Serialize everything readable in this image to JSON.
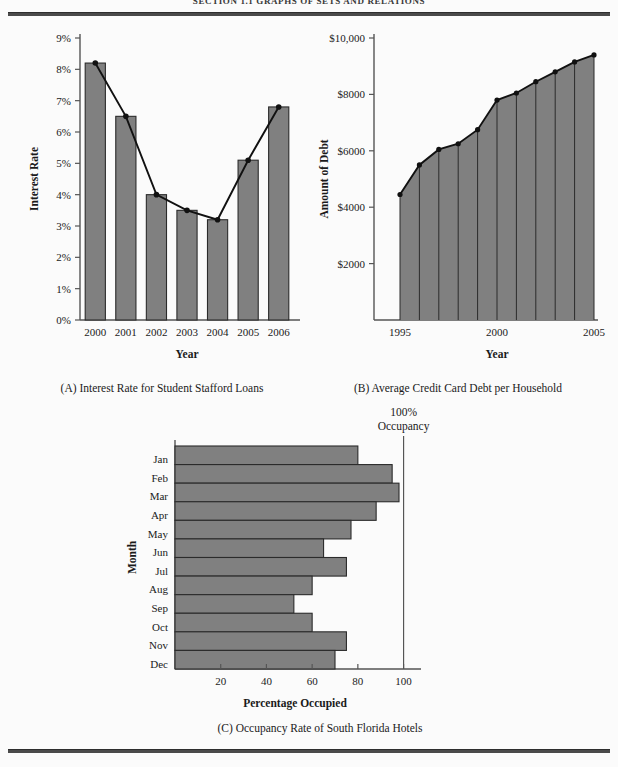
{
  "page": {
    "running_head": "SECTION 1.1  GRAPHS OF SETS AND RELATIONS",
    "background_color": "#fbfbfb",
    "rule_color": "#4a4a4a"
  },
  "style": {
    "bar_fill": "#808080",
    "bar_stroke": "#2b2b2b",
    "line_color": "#111111",
    "axis_color": "#555555"
  },
  "panels": [
    {
      "id": "A",
      "caption": "(A) Interest Rate for Student Stafford Loans",
      "chart_data": {
        "type": "bar",
        "title": "",
        "xlabel": "Year",
        "ylabel": "Interest Rate",
        "categories": [
          "2000",
          "2001",
          "2002",
          "2003",
          "2004",
          "2005",
          "2006"
        ],
        "values": [
          8.2,
          6.5,
          4.0,
          3.5,
          3.2,
          5.1,
          6.8
        ],
        "overlay_line": {
          "name": "Interest Rate trend",
          "values": [
            8.2,
            6.5,
            4.0,
            3.5,
            3.2,
            5.1,
            6.8
          ],
          "markers": true
        },
        "ylim": [
          0,
          9
        ],
        "ytick_labels": [
          "0%",
          "1%",
          "2%",
          "3%",
          "4%",
          "5%",
          "6%",
          "7%",
          "8%",
          "9%"
        ],
        "ytick_values": [
          0,
          1,
          2,
          3,
          4,
          5,
          6,
          7,
          8,
          9
        ],
        "grid": false,
        "legend": "none"
      }
    },
    {
      "id": "B",
      "caption": "(B) Average Credit Card Debt per Household",
      "chart_data": {
        "type": "area",
        "title": "",
        "xlabel": "Year",
        "ylabel": "Amount of Debt",
        "x": [
          1995,
          1996,
          1997,
          1998,
          1999,
          2000,
          2001,
          2002,
          2003,
          2004,
          2005
        ],
        "values": [
          4450,
          5500,
          6050,
          6250,
          6750,
          7800,
          8050,
          8450,
          8800,
          9150,
          9400
        ],
        "xtick_labels": [
          "1995",
          "2000",
          "2005"
        ],
        "xtick_values": [
          1995,
          2000,
          2005
        ],
        "ylim": [
          0,
          10000
        ],
        "ytick_labels": [
          "$2000",
          "$4000",
          "$6000",
          "$8000",
          "$10,000"
        ],
        "ytick_values": [
          2000,
          4000,
          6000,
          8000,
          10000
        ],
        "markers": true,
        "vertical_rules": true,
        "grid": false,
        "legend": "none"
      }
    },
    {
      "id": "C",
      "caption": "(C) Occupancy Rate of South Florida Hotels",
      "annotation": {
        "line1": "100%",
        "line2": "Occupancy",
        "at_value": 100
      },
      "chart_data": {
        "type": "bar",
        "orientation": "horizontal",
        "title": "",
        "xlabel": "Percentage Occupied",
        "ylabel": "Month",
        "categories": [
          "Jan",
          "Feb",
          "Mar",
          "Apr",
          "May",
          "Jun",
          "Jul",
          "Aug",
          "Sep",
          "Oct",
          "Nov",
          "Dec"
        ],
        "values": [
          80,
          95,
          98,
          88,
          77,
          65,
          75,
          60,
          52,
          60,
          75,
          70
        ],
        "xlim": [
          0,
          105
        ],
        "xtick_labels": [
          "20",
          "40",
          "60",
          "80",
          "100"
        ],
        "xtick_values": [
          20,
          40,
          60,
          80,
          100
        ],
        "grid": false,
        "legend": "none"
      }
    }
  ]
}
